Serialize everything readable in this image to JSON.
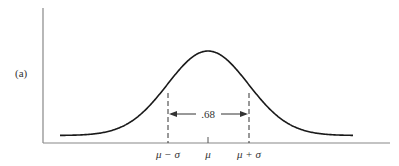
{
  "figure": {
    "panel_label": "(a)",
    "interval_value": ".68",
    "ticks": [
      {
        "label": "μ − σ",
        "x": 168
      },
      {
        "label": "μ",
        "x": 208
      },
      {
        "label": "μ + σ",
        "x": 249
      }
    ],
    "colors": {
      "curve": "#1a1a1a",
      "axis": "#888888",
      "text": "#333333"
    }
  },
  "chart_data": {
    "type": "line",
    "title": "",
    "subtitle": "Normal distribution curve",
    "panel_label": "(a)",
    "xlabel": "",
    "ylabel": "",
    "x_tick_labels": [
      "μ − σ",
      "μ",
      "μ + σ"
    ],
    "annotations": [
      {
        "text": ".68",
        "description": "Fraction of area between μ − σ and μ + σ, shown with double-headed arrow between dashed vertical lines"
      }
    ],
    "series": [
      {
        "name": "normal density",
        "x_sigma": [
          -3,
          -2,
          -1,
          0,
          1,
          2,
          3
        ],
        "y_relative": [
          0.011,
          0.135,
          0.607,
          1.0,
          0.607,
          0.135,
          0.011
        ]
      }
    ],
    "grid": false,
    "legend": "none"
  }
}
